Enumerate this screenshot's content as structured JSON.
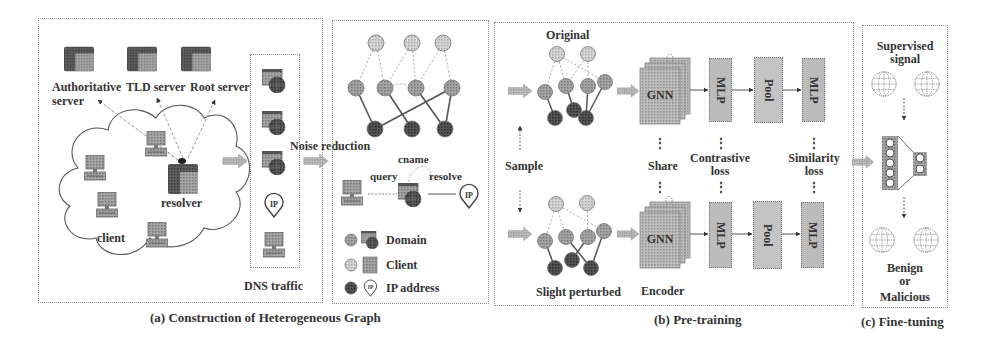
{
  "panel_a": {
    "caption": "(a) Construction of Heterogeneous Graph",
    "servers": {
      "authoritative_line1": "Authoritative",
      "authoritative_line2": "server",
      "tld": "TLD server",
      "root": "Root server"
    },
    "resolver_label": "resolver",
    "client_label": "client",
    "dns_traffic_label": "DNS traffic",
    "noise_reduction_label": "Noise reduction",
    "relation_labels": {
      "cname": "cname",
      "query": "query",
      "resolve": "resolve"
    },
    "ip_icon_text": "IP",
    "legend": [
      {
        "label": "Domain",
        "node_color": "#9a9a9a",
        "icon": "domain-web-icon"
      },
      {
        "label": "Client",
        "node_color": "#c4c4c4",
        "icon": "computer-icon"
      },
      {
        "label": "IP address",
        "node_color": "#3a3a3a",
        "icon": "ip-pin-icon"
      }
    ]
  },
  "panel_b": {
    "caption": "(b) Pre-training",
    "original_label": "Original",
    "perturbed_label": "Slight perturbed",
    "sample_label": "Sample",
    "share_label": "Share",
    "encoder_label": "Encoder",
    "gnn_label": "GNN",
    "mlp_label": "MLP",
    "pool_label": "Pool",
    "contrastive_loss_line1": "Contrastive",
    "contrastive_loss_line2": "loss",
    "similarity_loss_line1": "Similarity",
    "similarity_loss_line2": "loss",
    "ellipsis": "⋮"
  },
  "panel_c": {
    "caption": "(c) Fine-tuning",
    "supervised_line1": "Supervised",
    "supervised_line2": "signal",
    "result_line1": "Benign",
    "result_line2": "or",
    "result_line3": "Malicious"
  },
  "colors": {
    "border": "#8a8a8a",
    "light_node": "#c4c4c4",
    "mid_node": "#9a9a9a",
    "dark_node": "#3a3a3a",
    "block_fill": "#b8b8b8",
    "arrow_fill": "#a8a8a8"
  }
}
